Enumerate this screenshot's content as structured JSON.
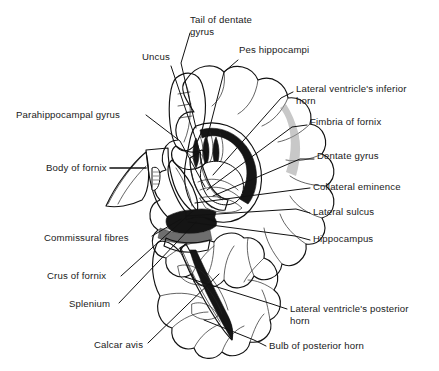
{
  "figure": {
    "background_color": "#ffffff",
    "ink_color": "#111111",
    "width": 439,
    "height": 371
  },
  "labels": {
    "tail_of_dentate_gyrus_l1": "Tail of dentate",
    "tail_of_dentate_gyrus_l2": "gyrus",
    "uncus": "Uncus",
    "pes_hippocampi": "Pes hippocampi",
    "lateral_ventricle_inferior_horn_l1": "Lateral ventricle's inferior",
    "lateral_ventricle_inferior_horn_l2": "horn",
    "parahippocampal_gyrus": "Parahippocampal gyrus",
    "fimbria_of_fornix": "Fimbria of fornix",
    "dentate_gyrus": "Dentate gyrus",
    "body_of_fornix": "Body of fornix",
    "collateral_eminence": "Collateral eminence",
    "lateral_sulcus": "Lateral sulcus",
    "hippocampus": "Hippocampus",
    "commissural_fibres": "Commissural fibres",
    "crus_of_fornix": "Crus of fornix",
    "splenium": "Splenium",
    "lateral_ventricle_posterior_horn_l1": "Lateral ventricle's posterior",
    "lateral_ventricle_posterior_horn_l2": "horn",
    "calcar_avis": "Calcar avis",
    "bulb_of_posterior_horn": "Bulb of posterior horn"
  },
  "label_positions": {
    "tail_of_dentate_gyrus": {
      "x": 190,
      "y": 23,
      "anchor": "start"
    },
    "uncus": {
      "x": 142,
      "y": 60,
      "anchor": "start"
    },
    "pes_hippocampi": {
      "x": 239,
      "y": 53,
      "anchor": "start"
    },
    "lateral_ventricle_inferior_horn": {
      "x": 296,
      "y": 92,
      "anchor": "start"
    },
    "parahippocampal_gyrus": {
      "x": 16,
      "y": 118,
      "anchor": "start"
    },
    "fimbria_of_fornix": {
      "x": 310,
      "y": 125,
      "anchor": "start"
    },
    "dentate_gyrus": {
      "x": 317,
      "y": 159,
      "anchor": "start"
    },
    "body_of_fornix": {
      "x": 46,
      "y": 171,
      "anchor": "start"
    },
    "collateral_eminence": {
      "x": 313,
      "y": 190,
      "anchor": "start"
    },
    "lateral_sulcus": {
      "x": 313,
      "y": 215,
      "anchor": "start"
    },
    "hippocampus": {
      "x": 313,
      "y": 242,
      "anchor": "start"
    },
    "commissural_fibres": {
      "x": 44,
      "y": 241,
      "anchor": "start"
    },
    "crus_of_fornix": {
      "x": 47,
      "y": 279,
      "anchor": "start"
    },
    "splenium": {
      "x": 69,
      "y": 307,
      "anchor": "start"
    },
    "lateral_ventricle_posterior_horn": {
      "x": 290,
      "y": 312,
      "anchor": "start"
    },
    "calcar_avis": {
      "x": 94,
      "y": 348,
      "anchor": "start"
    },
    "bulb_of_posterior_horn": {
      "x": 269,
      "y": 349,
      "anchor": "start"
    }
  },
  "leader_lines": {
    "tail_of_dentate_gyrus": "M 190 33 L 181 63 L 196 128",
    "uncus": "M 171 66 L 201 155",
    "pes_hippocampi": "M 238 60 L 224 72 L 205 146",
    "lateral_ventricle_inferior_horn": "M 293 92 L 281 98 L 213 175",
    "parahippocampal_gyrus": "M 146 115 L 180 141 L 205 187",
    "fimbria_of_fornix": "M 307 125 L 292 127 L 207 190",
    "dentate_gyrus": "M 314 159 L 300 159 L 213 196",
    "body_of_fornix": "M 110 168 L 146 168",
    "collateral_eminence": "M 310 188 L 294 190 L 195 203",
    "lateral_sulcus": "M 310 213 L 296 209 L 186 216",
    "hippocampus": "M 310 240 L 295 236 L 188 222",
    "commissural_fibres": "M 152 236 L 181 219",
    "crus_of_fornix": "M 121 276 L 193 211",
    "splenium": "M 119 303 L 196 222",
    "lateral_ventricle_posterior_horn": "M 287 309 L 272 304 L 185 277",
    "calcar_avis": "M 148 343 L 219 274",
    "bulb_of_posterior_horn": "M 266 346 L 254 340 L 204 320"
  }
}
